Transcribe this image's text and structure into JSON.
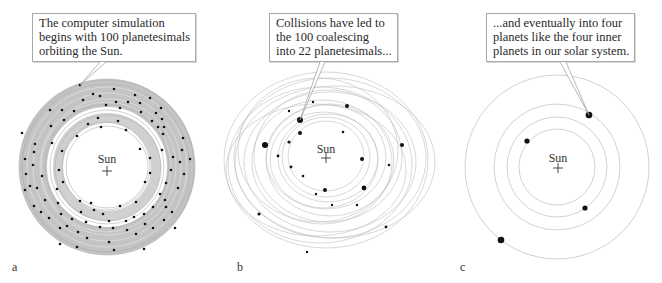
{
  "panels": [
    {
      "label": "a",
      "caption": [
        "The computer simulation",
        "begins with 100 planetesimals",
        "orbiting the Sun."
      ],
      "sun_label": "Sun",
      "planetesimal_count": 100
    },
    {
      "label": "b",
      "caption": [
        "Collisions have led to",
        "the 100 coalescing",
        "into 22 planetesimals..."
      ],
      "sun_label": "Sun",
      "planetesimal_count": 22
    },
    {
      "label": "c",
      "caption": [
        "...and eventually into four",
        "planets like the four inner",
        "planets in our solar system."
      ],
      "sun_label": "Sun",
      "planetesimal_count": 4
    }
  ],
  "colors": {
    "orbit": "#b5b5b5",
    "band": "#c4c4c4",
    "body": "#111111",
    "callout_border": "#a8a8a8"
  }
}
